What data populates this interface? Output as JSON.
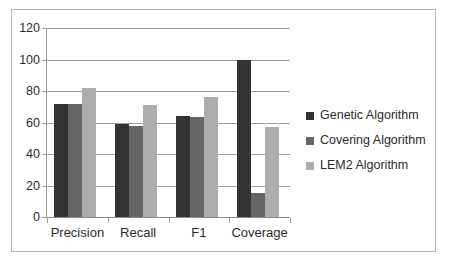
{
  "chart_data": {
    "type": "bar",
    "title": "",
    "subtitle": "",
    "xlabel": "",
    "ylabel": "",
    "categories": [
      "Precision",
      "Recall",
      "F1",
      "Coverage"
    ],
    "series": [
      {
        "name": "Genetic Algorithm",
        "color": "#333333",
        "values": [
          72,
          59,
          64,
          100
        ]
      },
      {
        "name": "Covering Algorithm",
        "color": "#666666",
        "values": [
          72,
          58,
          63.5,
          15
        ]
      },
      {
        "name": "LEM2 Algorithm",
        "color": "#adadad",
        "values": [
          82,
          71,
          76,
          57
        ]
      }
    ],
    "ylim": [
      0,
      120
    ],
    "yticks": [
      0,
      20,
      40,
      60,
      80,
      100,
      120
    ],
    "ytick_labels": [
      "0",
      "20",
      "40",
      "60",
      "80",
      "100",
      "120"
    ],
    "grid": true,
    "grid_axis": "y",
    "legend_position": "right",
    "orientation": "vertical",
    "grouping": "clustered"
  },
  "colors": {
    "background": "#ffffff",
    "frame_border": "#b4b4b4",
    "gridline": "#9e9e9e",
    "axis": "#9e9e9e",
    "text": "#2b2b2b",
    "series_genetic": "#333333",
    "series_covering": "#666666",
    "series_lem2": "#adadad"
  },
  "icons": {
    "legend_swatch": "filled-square-icon"
  }
}
